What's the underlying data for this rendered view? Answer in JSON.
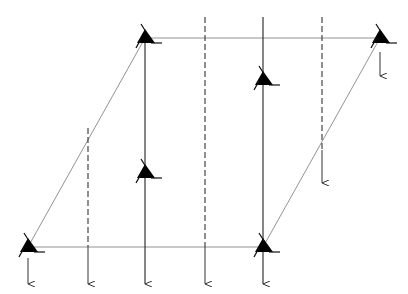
{
  "diagram": {
    "type": "lattice-parallelogram",
    "colors": {
      "background": "#ffffff",
      "line": "#555555",
      "solid_line": "#222222",
      "triangle": "#000000"
    },
    "parallelogram": {
      "corners": [
        [
          145,
          38
        ],
        [
          380,
          38
        ],
        [
          263,
          247
        ],
        [
          28,
          247
        ]
      ]
    },
    "triangles": [
      {
        "id": "top-left-corner",
        "x": 145,
        "y": 38
      },
      {
        "id": "top-right-corner",
        "x": 380,
        "y": 38
      },
      {
        "id": "bottom-left-corner",
        "x": 28,
        "y": 247
      },
      {
        "id": "bottom-right-corner",
        "x": 263,
        "y": 247
      },
      {
        "id": "center-left",
        "x": 145,
        "y": 173
      },
      {
        "id": "center-right",
        "x": 263,
        "y": 80
      }
    ],
    "vertical_lines": [
      {
        "id": "solid-left",
        "x": 145,
        "y1": 38,
        "y2": 284,
        "style": "solid",
        "arrow": true
      },
      {
        "id": "solid-right",
        "x": 263,
        "y1": 17,
        "y2": 284,
        "style": "solid",
        "arrow": true
      },
      {
        "id": "dashed-left",
        "x": 88,
        "y1": 128,
        "dash_end": 247,
        "y2": 284,
        "style": "dashed",
        "arrow": true
      },
      {
        "id": "dashed-center",
        "x": 205,
        "y1": 17,
        "dash_end": 247,
        "y2": 284,
        "style": "dashed",
        "arrow": true
      },
      {
        "id": "dashed-right",
        "x": 322,
        "y1": 17,
        "dash_end": 150,
        "y2": 183,
        "style": "dashed",
        "arrow": true
      }
    ],
    "short_arrows": [
      {
        "id": "arrow-bottom-left",
        "x": 28,
        "y1": 258,
        "y2": 284
      },
      {
        "id": "arrow-top-right",
        "x": 380,
        "y1": 52,
        "y2": 76
      }
    ]
  }
}
